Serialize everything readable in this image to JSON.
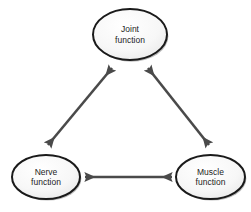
{
  "diagram": {
    "type": "cycle-triangle",
    "background_color": "#ffffff",
    "node_fill_color": "#f4f4f4",
    "node_stroke_color": "#1a1a1a",
    "node_shadow_color": "#9a9a9a",
    "arrow_color": "#4a4a4a",
    "text_color": "#1d1d1d",
    "nodes": [
      {
        "id": "joint",
        "line1": "Joint",
        "line2": "function",
        "cx": 130,
        "cy": 34.5,
        "rx": 37,
        "ry": 25.5
      },
      {
        "id": "nerve",
        "line1": "Nerve",
        "line2": "function",
        "cx": 46,
        "cy": 177,
        "rx": 34,
        "ry": 22
      },
      {
        "id": "muscle",
        "line1": "Muscle",
        "line2": "function",
        "cx": 210.5,
        "cy": 177,
        "rx": 34.5,
        "ry": 22
      }
    ],
    "connectors": [
      {
        "id": "nerve-joint",
        "from": "nerve",
        "to": "joint",
        "arrowheads": "both",
        "x1": 48,
        "y1": 145,
        "x2": 112,
        "y2": 68
      },
      {
        "id": "joint-muscle",
        "from": "joint",
        "to": "muscle",
        "arrowheads": "both",
        "x1": 148,
        "y1": 68,
        "x2": 209,
        "y2": 145
      },
      {
        "id": "nerve-muscle",
        "from": "nerve",
        "to": "muscle",
        "arrowheads": "both",
        "x1": 84,
        "y1": 177,
        "x2": 173,
        "y2": 177
      }
    ]
  }
}
